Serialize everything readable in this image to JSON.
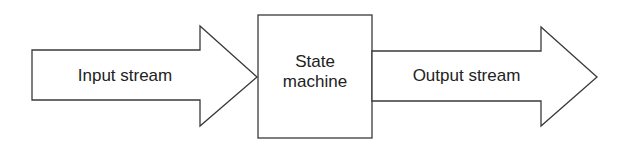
{
  "diagram": {
    "input_arrow": {
      "label": "Input stream"
    },
    "state_box": {
      "line1": "State",
      "line2": "machine"
    },
    "output_arrow": {
      "label": "Output stream"
    }
  },
  "colors": {
    "stroke": "#3a3a3a",
    "text": "#222222",
    "background": "#ffffff"
  }
}
